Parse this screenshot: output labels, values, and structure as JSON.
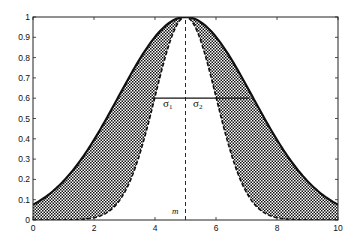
{
  "chart_data": {
    "type": "line",
    "title": "",
    "xlabel": "",
    "ylabel": "",
    "xlim": [
      0,
      10
    ],
    "ylim": [
      0,
      1
    ],
    "grid": false,
    "x_ticks": [
      "0",
      "2",
      "4",
      "6",
      "8",
      "10"
    ],
    "y_ticks": [
      "0",
      "0.1",
      "0.2",
      "0.3",
      "0.4",
      "0.5",
      "0.6",
      "0.7",
      "0.8",
      "0.9",
      "1"
    ],
    "series": [
      {
        "name": "outer membership (solid)",
        "style": "solid",
        "center": 5,
        "sigma": 2.2,
        "x": [
          0,
          1,
          2,
          3,
          4,
          5,
          6,
          7,
          8,
          9,
          10
        ],
        "values": [
          0.04,
          0.19,
          0.39,
          0.66,
          0.9,
          1.0,
          0.9,
          0.66,
          0.39,
          0.19,
          0.04
        ]
      },
      {
        "name": "inner membership (dashed)",
        "style": "dashed",
        "center": 5,
        "sigma_left": 1.0,
        "sigma_right": 1.0,
        "x": [
          0,
          1,
          2,
          3,
          4,
          5,
          6,
          7,
          8,
          9,
          10
        ],
        "values": [
          0.0,
          0.0,
          0.01,
          0.14,
          0.61,
          1.0,
          0.61,
          0.14,
          0.01,
          0.0,
          0.0
        ]
      }
    ],
    "shaded_region": "between outer and inner curves (dotted hatch)",
    "annotations": [
      {
        "text": "σ1",
        "x": 4.4,
        "y": 0.55
      },
      {
        "text": "σ2",
        "x": 5.3,
        "y": 0.55
      },
      {
        "text": "m",
        "x": 4.6,
        "y": 0.03
      },
      {
        "type": "hline",
        "y": 0.6,
        "x_from": 3.9,
        "x_to": 7.1
      },
      {
        "type": "vline-dashed",
        "x": 5,
        "y_from": 0,
        "y_to": 1
      }
    ]
  },
  "labels": {
    "sigma1_base": "σ",
    "sigma1_sub": "1",
    "sigma2_base": "σ",
    "sigma2_sub": "2",
    "mean": "m"
  }
}
